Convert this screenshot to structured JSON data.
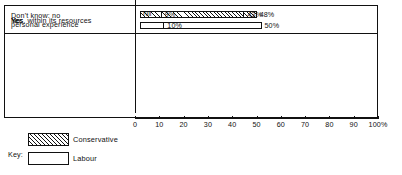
{
  "chart_data": {
    "type": "bar",
    "orientation": "horizontal",
    "title": "",
    "xlabel": "",
    "ylabel": "",
    "xlim": [
      0,
      100
    ],
    "grid": false,
    "legend_position": "bottom-left",
    "categories": [
      "Yes",
      "Yes, within its resources",
      "No",
      "Don't know: no\npersonal experience"
    ],
    "series": [
      {
        "name": "Conservative",
        "fill": "diagonal-hatch",
        "values": [
          48,
          43,
          9,
          0
        ],
        "labels": [
          "48%",
          "43%",
          "9%",
          "Nil"
        ]
      },
      {
        "name": "Labour",
        "fill": "white",
        "values": [
          28,
          12,
          50,
          10
        ],
        "labels": [
          "28%",
          "12%",
          "50%",
          "10%"
        ]
      }
    ],
    "ticks": [
      {
        "value": 0,
        "label": "0"
      },
      {
        "value": 10,
        "label": "10"
      },
      {
        "value": 20,
        "label": "20"
      },
      {
        "value": 30,
        "label": "30"
      },
      {
        "value": 40,
        "label": "40"
      },
      {
        "value": 50,
        "label": "50"
      },
      {
        "value": 60,
        "label": "60"
      },
      {
        "value": 70,
        "label": "70"
      },
      {
        "value": 80,
        "label": "80"
      },
      {
        "value": 90,
        "label": "90"
      },
      {
        "value": 100,
        "label": "100%"
      }
    ]
  },
  "key": {
    "title": "Key:",
    "entries": [
      {
        "label": "Conservative",
        "fill": "diagonal-hatch"
      },
      {
        "label": "Labour",
        "fill": "white"
      }
    ]
  },
  "colors": {
    "line": "#111111",
    "background": "#ffffff",
    "hatch": "#111111"
  }
}
